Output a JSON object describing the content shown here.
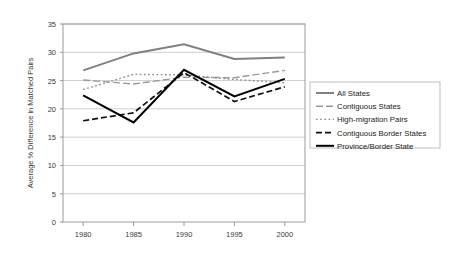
{
  "chart_data": {
    "type": "line",
    "title": "",
    "xlabel": "",
    "ylabel": "Average % Difference in Matched Pairs",
    "x": [
      1980,
      1985,
      1990,
      1995,
      2000
    ],
    "categories": [
      "1980",
      "1985",
      "1990",
      "1995",
      "2000"
    ],
    "xlim": [
      1978,
      2002
    ],
    "ylim": [
      0,
      35
    ],
    "yticks": [
      0,
      5,
      10,
      15,
      20,
      25,
      30,
      35
    ],
    "ytick_labels": [
      "0",
      "5",
      "10",
      "15",
      "20",
      "25",
      "30",
      "35"
    ],
    "xtick_labels": [
      "1980",
      "1985",
      "1990",
      "1995",
      "2000"
    ],
    "grid": "horizontal",
    "legend_position": "right",
    "series": [
      {
        "name": "All States",
        "values": [
          26.8,
          29.8,
          31.4,
          28.8,
          29.1
        ],
        "color": "#808080",
        "style": "solid",
        "width": 2.0,
        "dash": ""
      },
      {
        "name": "Contiguous States",
        "values": [
          25.1,
          24.4,
          25.6,
          25.5,
          26.8
        ],
        "color": "#999999",
        "style": "dashed",
        "width": 1.4,
        "dash": "7,3"
      },
      {
        "name": "High-migration Pairs",
        "values": [
          23.4,
          26.1,
          26.0,
          25.2,
          24.6
        ],
        "color": "#888888",
        "style": "dotted",
        "width": 1.4,
        "dash": "1.6,2.6"
      },
      {
        "name": "Contiguous Border States",
        "values": [
          17.9,
          19.3,
          26.4,
          21.3,
          23.9
        ],
        "color": "#111111",
        "style": "dashed",
        "width": 1.7,
        "dash": "6,3"
      },
      {
        "name": "Province/Border State",
        "values": [
          22.4,
          17.6,
          26.9,
          22.2,
          25.3
        ],
        "color": "#000000",
        "style": "solid",
        "width": 2.0,
        "dash": ""
      }
    ]
  },
  "legend": {
    "items": [
      {
        "label": "All States"
      },
      {
        "label": "Contiguous States"
      },
      {
        "label": "High-migration Pairs"
      },
      {
        "label": "Contiguous Border States"
      },
      {
        "label": "Province/Border State"
      }
    ]
  },
  "colors": {
    "background": "#ffffff",
    "frame": "#9a9a9a",
    "gridline": "#cfcfcf",
    "axis_text": "#3a3a3a",
    "legend_border": "#bdbdbd"
  }
}
